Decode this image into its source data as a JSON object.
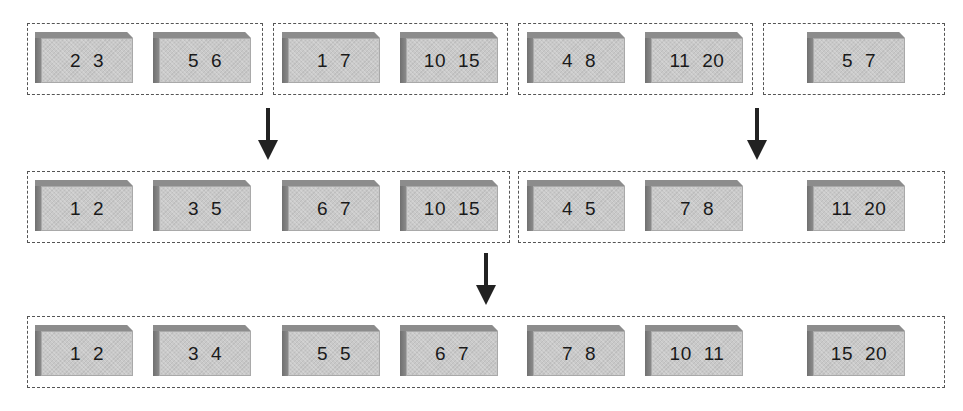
{
  "diagram": {
    "type": "merge-sort-blocks",
    "rows": [
      {
        "groups": [
          {
            "blocks": [
              {
                "a": "2",
                "b": "3"
              },
              {
                "a": "5",
                "b": "6"
              }
            ]
          },
          {
            "blocks": [
              {
                "a": "1",
                "b": "7"
              },
              {
                "a": "10",
                "b": "15"
              }
            ]
          },
          {
            "blocks": [
              {
                "a": "4",
                "b": "8"
              },
              {
                "a": "11",
                "b": "20"
              }
            ]
          },
          {
            "blocks": [
              {
                "a": "5",
                "b": "7"
              }
            ]
          }
        ]
      },
      {
        "groups": [
          {
            "blocks": [
              {
                "a": "1",
                "b": "2"
              },
              {
                "a": "3",
                "b": "5"
              },
              {
                "a": "6",
                "b": "7"
              },
              {
                "a": "10",
                "b": "15"
              }
            ]
          },
          {
            "blocks": [
              {
                "a": "4",
                "b": "5"
              },
              {
                "a": "7",
                "b": "8"
              },
              {
                "a": "11",
                "b": "20"
              }
            ]
          }
        ]
      },
      {
        "groups": [
          {
            "blocks": [
              {
                "a": "1",
                "b": "2"
              },
              {
                "a": "3",
                "b": "4"
              },
              {
                "a": "5",
                "b": "5"
              },
              {
                "a": "6",
                "b": "7"
              },
              {
                "a": "7",
                "b": "8"
              },
              {
                "a": "10",
                "b": "11"
              },
              {
                "a": "15",
                "b": "20"
              }
            ]
          }
        ]
      }
    ],
    "arrows": [
      "down",
      "down",
      "down"
    ]
  }
}
